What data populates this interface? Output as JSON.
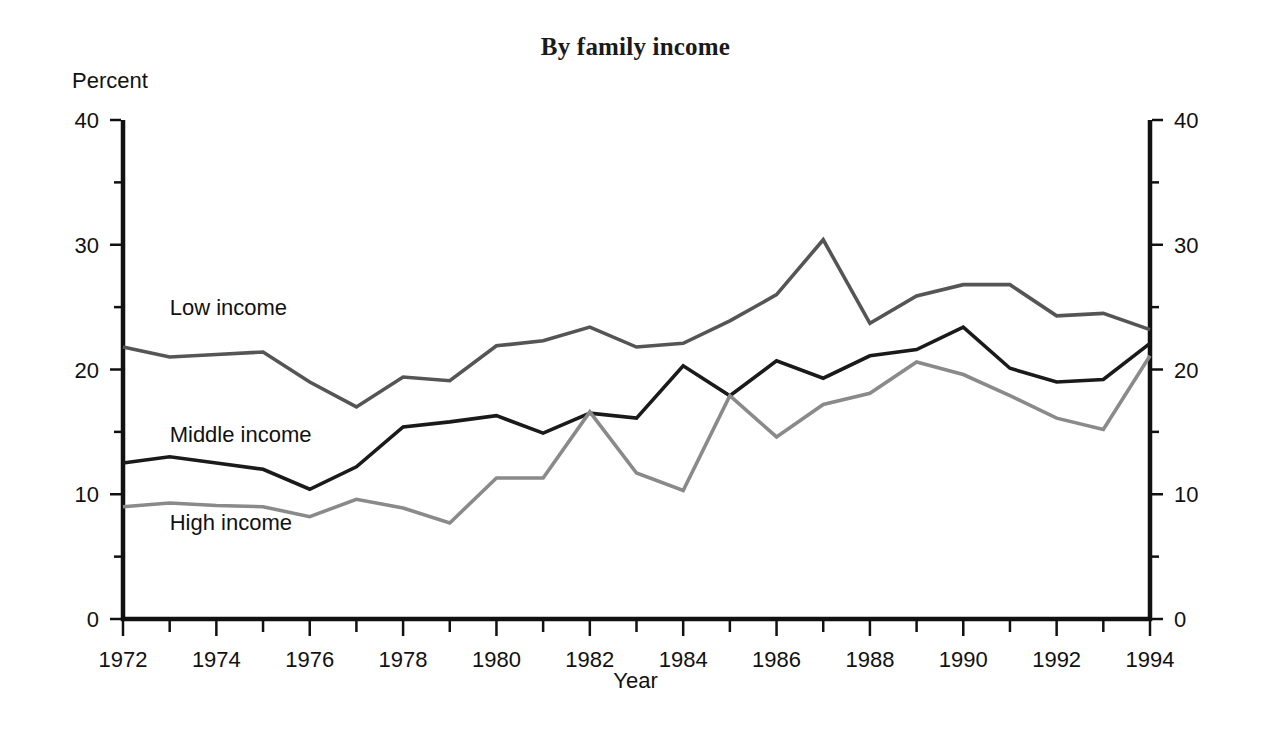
{
  "chart_data": {
    "type": "line",
    "title": "By family income",
    "xlabel": "Year",
    "ylabel": "Percent",
    "ylim": [
      0,
      40
    ],
    "xlim": [
      1972,
      1994
    ],
    "ytick_labels": [
      "0",
      "10",
      "20",
      "30",
      "40"
    ],
    "ytick_values": [
      0,
      10,
      20,
      30,
      40
    ],
    "yminor_values": [
      5,
      15,
      25,
      35
    ],
    "xtick_labels": [
      "1972",
      "1974",
      "1976",
      "1978",
      "1980",
      "1982",
      "1984",
      "1986",
      "1988",
      "1990",
      "1992",
      "1994"
    ],
    "xtick_values": [
      1972,
      1974,
      1976,
      1978,
      1980,
      1982,
      1984,
      1986,
      1988,
      1990,
      1992,
      1994
    ],
    "xminor_values": [
      1973,
      1975,
      1977,
      1979,
      1981,
      1983,
      1985,
      1987,
      1989,
      1991,
      1993
    ],
    "x_labeled_left": [
      "1972",
      "1976",
      "1978",
      "1980",
      "1982"
    ],
    "grid": false,
    "legend": "inline-labels",
    "right_axis_mirrored": true,
    "right_ytick_labels": [
      "0",
      "10",
      "20",
      "30",
      "40"
    ],
    "x": [
      1972,
      1973,
      1974,
      1975,
      1976,
      1977,
      1978,
      1979,
      1980,
      1981,
      1982,
      1983,
      1984,
      1985,
      1986,
      1987,
      1988,
      1989,
      1990,
      1991,
      1992,
      1993,
      1994
    ],
    "series": [
      {
        "name": "Low income",
        "color": "#555555",
        "label_x": 1973.0,
        "label_y": 24.4,
        "values": [
          21.8,
          21.0,
          21.2,
          21.4,
          19.0,
          17.0,
          19.4,
          19.1,
          21.9,
          22.3,
          23.4,
          21.8,
          22.1,
          23.9,
          26.0,
          30.4,
          23.7,
          25.9,
          26.8,
          26.8,
          24.3,
          24.5,
          23.2
        ]
      },
      {
        "name": "Middle income",
        "color": "#1a1a1a",
        "label_x": 1973.0,
        "label_y": 14.2,
        "values": [
          12.5,
          13.0,
          12.5,
          12.0,
          10.4,
          12.2,
          15.4,
          15.8,
          16.3,
          14.9,
          16.5,
          16.1,
          20.3,
          17.9,
          20.7,
          19.3,
          21.1,
          21.6,
          23.4,
          20.1,
          19.0,
          19.2,
          22.1
        ]
      },
      {
        "name": "High income",
        "color": "#8a8a8a",
        "label_x": 1973.0,
        "label_y": 7.1,
        "values": [
          9.0,
          9.3,
          9.1,
          9.0,
          8.2,
          9.6,
          8.9,
          7.7,
          11.3,
          11.3,
          16.6,
          11.7,
          10.3,
          17.9,
          14.6,
          17.2,
          18.1,
          20.6,
          19.6,
          17.9,
          16.1,
          15.2,
          21.1
        ]
      }
    ]
  },
  "layout": {
    "plot_left": 123,
    "plot_right": 1150,
    "plot_top": 120,
    "plot_bottom": 619
  }
}
